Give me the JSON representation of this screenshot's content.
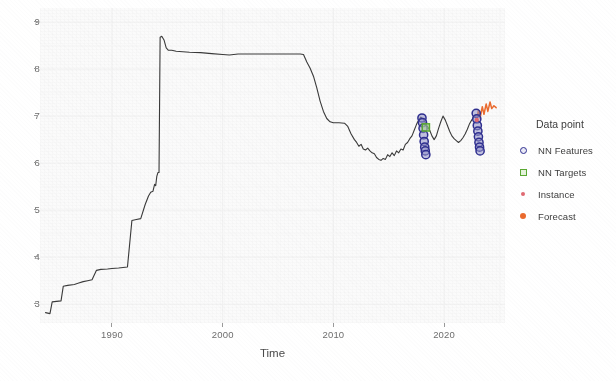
{
  "chart_data": {
    "type": "line",
    "title": "",
    "xlabel": "Time",
    "ylabel": "",
    "xlim": [
      1983.5,
      2025.5
    ],
    "ylim": [
      2.6,
      9.3
    ],
    "grid": true,
    "xticks": [
      "1990",
      "2000",
      "2010",
      "2020"
    ],
    "xtick_values": [
      1990,
      2000,
      2010,
      2020
    ],
    "yticks": [
      "3",
      "4",
      "5",
      "6",
      "7",
      "8",
      "9"
    ],
    "ytick_values": [
      3,
      4,
      5,
      6,
      7,
      8,
      9
    ],
    "legend": {
      "title": "Data point",
      "position": "right",
      "entries": [
        {
          "label": "NN Features",
          "marker": "open-circle",
          "color": "#2f2f8f"
        },
        {
          "label": "NN Targets",
          "marker": "open-square",
          "color": "#5aa832"
        },
        {
          "label": "Instance",
          "marker": "small-dot",
          "color": "#e06a72"
        },
        {
          "label": "Forecast",
          "marker": "filled-dot",
          "color": "#ea6a2e"
        }
      ]
    },
    "series": [
      {
        "name": "History",
        "type": "line",
        "color": "#3a3a3a",
        "points": [
          [
            1984.0,
            2.82
          ],
          [
            1984.4,
            2.8
          ],
          [
            1984.6,
            3.05
          ],
          [
            1985.0,
            3.06
          ],
          [
            1985.4,
            3.07
          ],
          [
            1985.6,
            3.38
          ],
          [
            1986.0,
            3.4
          ],
          [
            1986.6,
            3.42
          ],
          [
            1987.0,
            3.45
          ],
          [
            1987.4,
            3.48
          ],
          [
            1987.8,
            3.5
          ],
          [
            1988.2,
            3.52
          ],
          [
            1988.6,
            3.72
          ],
          [
            1989.0,
            3.74
          ],
          [
            1989.6,
            3.75
          ],
          [
            1990.0,
            3.76
          ],
          [
            1990.6,
            3.77
          ],
          [
            1991.0,
            3.78
          ],
          [
            1991.4,
            3.79
          ],
          [
            1991.8,
            4.78
          ],
          [
            1992.2,
            4.8
          ],
          [
            1992.6,
            4.82
          ],
          [
            1993.0,
            5.12
          ],
          [
            1993.3,
            5.3
          ],
          [
            1993.5,
            5.38
          ],
          [
            1993.7,
            5.4
          ],
          [
            1993.85,
            5.55
          ],
          [
            1993.95,
            5.52
          ],
          [
            1994.05,
            5.72
          ],
          [
            1994.15,
            5.8
          ],
          [
            1994.25,
            5.8
          ],
          [
            1994.35,
            8.68
          ],
          [
            1994.5,
            8.7
          ],
          [
            1994.7,
            8.62
          ],
          [
            1994.9,
            8.45
          ],
          [
            1995.1,
            8.4
          ],
          [
            1995.4,
            8.4
          ],
          [
            1995.8,
            8.38
          ],
          [
            1996.4,
            8.37
          ],
          [
            1997.0,
            8.36
          ],
          [
            1998.0,
            8.35
          ],
          [
            1999.0,
            8.33
          ],
          [
            2000.0,
            8.31
          ],
          [
            2000.6,
            8.3
          ],
          [
            2001.4,
            8.32
          ],
          [
            2002.4,
            8.32
          ],
          [
            2003.4,
            8.32
          ],
          [
            2004.4,
            8.32
          ],
          [
            2005.4,
            8.32
          ],
          [
            2006.4,
            8.32
          ],
          [
            2007.0,
            8.32
          ],
          [
            2007.3,
            8.31
          ],
          [
            2007.6,
            8.15
          ],
          [
            2007.9,
            8.02
          ],
          [
            2008.2,
            7.85
          ],
          [
            2008.5,
            7.6
          ],
          [
            2008.8,
            7.32
          ],
          [
            2009.1,
            7.1
          ],
          [
            2009.4,
            6.95
          ],
          [
            2009.7,
            6.88
          ],
          [
            2010.0,
            6.86
          ],
          [
            2010.5,
            6.86
          ],
          [
            2011.0,
            6.85
          ],
          [
            2011.3,
            6.78
          ],
          [
            2011.6,
            6.62
          ],
          [
            2011.9,
            6.5
          ],
          [
            2012.1,
            6.44
          ],
          [
            2012.3,
            6.36
          ],
          [
            2012.5,
            6.4
          ],
          [
            2012.7,
            6.3
          ],
          [
            2012.9,
            6.28
          ],
          [
            2013.1,
            6.32
          ],
          [
            2013.3,
            6.26
          ],
          [
            2013.5,
            6.22
          ],
          [
            2013.7,
            6.2
          ],
          [
            2013.9,
            6.12
          ],
          [
            2014.1,
            6.08
          ],
          [
            2014.3,
            6.06
          ],
          [
            2014.5,
            6.1
          ],
          [
            2014.7,
            6.08
          ],
          [
            2014.9,
            6.18
          ],
          [
            2015.1,
            6.14
          ],
          [
            2015.3,
            6.22
          ],
          [
            2015.5,
            6.16
          ],
          [
            2015.7,
            6.26
          ],
          [
            2015.9,
            6.22
          ],
          [
            2016.1,
            6.3
          ],
          [
            2016.3,
            6.28
          ],
          [
            2016.5,
            6.4
          ],
          [
            2016.7,
            6.44
          ],
          [
            2016.9,
            6.52
          ],
          [
            2017.1,
            6.58
          ],
          [
            2017.3,
            6.7
          ],
          [
            2017.5,
            6.82
          ],
          [
            2017.7,
            6.92
          ],
          [
            2017.9,
            6.98
          ],
          [
            2018.1,
            6.94
          ],
          [
            2018.3,
            6.86
          ],
          [
            2018.5,
            6.78
          ],
          [
            2018.7,
            6.7
          ],
          [
            2018.9,
            6.58
          ],
          [
            2019.1,
            6.5
          ],
          [
            2019.3,
            6.58
          ],
          [
            2019.5,
            6.74
          ],
          [
            2019.7,
            6.88
          ],
          [
            2019.9,
            7.0
          ],
          [
            2020.1,
            6.92
          ],
          [
            2020.3,
            6.8
          ],
          [
            2020.5,
            6.68
          ],
          [
            2020.7,
            6.58
          ],
          [
            2020.9,
            6.52
          ],
          [
            2021.1,
            6.48
          ],
          [
            2021.3,
            6.44
          ],
          [
            2021.5,
            6.48
          ],
          [
            2021.7,
            6.54
          ],
          [
            2021.9,
            6.62
          ],
          [
            2022.1,
            6.72
          ],
          [
            2022.3,
            6.84
          ],
          [
            2022.5,
            6.92
          ],
          [
            2022.7,
            6.98
          ],
          [
            2022.9,
            7.02
          ]
        ]
      },
      {
        "name": "Forecast",
        "type": "line",
        "color": "#ea6a2e",
        "points": [
          [
            2022.9,
            6.9
          ],
          [
            2023.1,
            7.12
          ],
          [
            2023.25,
            6.96
          ],
          [
            2023.45,
            7.2
          ],
          [
            2023.6,
            7.04
          ],
          [
            2023.8,
            7.26
          ],
          [
            2023.95,
            7.1
          ],
          [
            2024.15,
            7.3
          ],
          [
            2024.3,
            7.16
          ],
          [
            2024.5,
            7.22
          ],
          [
            2024.7,
            7.18
          ]
        ]
      }
    ],
    "markers": {
      "nn_features": {
        "label": "NN Features",
        "marker": "open-circle",
        "color": "#2f2f8f",
        "points": [
          [
            2018.0,
            6.96
          ],
          [
            2018.05,
            6.86
          ],
          [
            2018.1,
            6.74
          ],
          [
            2018.15,
            6.6
          ],
          [
            2018.2,
            6.46
          ],
          [
            2018.25,
            6.34
          ],
          [
            2018.3,
            6.26
          ],
          [
            2018.35,
            6.18
          ],
          [
            2022.9,
            7.06
          ],
          [
            2022.95,
            6.94
          ],
          [
            2023.0,
            6.8
          ],
          [
            2023.05,
            6.68
          ],
          [
            2023.1,
            6.56
          ],
          [
            2023.15,
            6.44
          ],
          [
            2023.2,
            6.34
          ],
          [
            2023.25,
            6.26
          ]
        ]
      },
      "nn_targets": {
        "label": "NN Targets",
        "marker": "open-square",
        "color": "#5aa832",
        "points": [
          [
            2018.35,
            6.76
          ]
        ]
      },
      "instance": {
        "label": "Instance",
        "marker": "small-dot",
        "color": "#e06a72",
        "points": [
          [
            2022.95,
            6.92
          ]
        ]
      }
    }
  }
}
